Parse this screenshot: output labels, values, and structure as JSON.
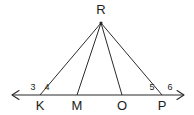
{
  "figure": {
    "type": "geometry-diagram",
    "background_color": "#ffffff",
    "stroke_color": "#2b2b2b",
    "text_color": "#1c1c1c",
    "apex": {
      "name": "apex-point",
      "label": "R",
      "x": 101,
      "y": 23,
      "label_x": 101,
      "label_y": 14
    },
    "baseline": {
      "name": "base-line",
      "y": 95,
      "x_start": 12,
      "x_end": 184,
      "arrow_left": true,
      "arrow_right": true
    },
    "base_points": [
      {
        "label": "K",
        "x": 40,
        "label_x": 40,
        "label_y": 110
      },
      {
        "label": "M",
        "x": 77,
        "label_x": 77,
        "label_y": 110
      },
      {
        "label": "O",
        "x": 122,
        "label_x": 122,
        "label_y": 110
      },
      {
        "label": "P",
        "x": 162,
        "label_x": 162,
        "label_y": 110
      }
    ],
    "segments": [
      {
        "name": "segment-RK",
        "from": "R",
        "to": "K"
      },
      {
        "name": "segment-RM",
        "from": "R",
        "to": "M"
      },
      {
        "name": "segment-RO",
        "from": "R",
        "to": "O"
      },
      {
        "name": "segment-RP",
        "from": "R",
        "to": "P"
      }
    ],
    "angle_labels": [
      {
        "label": "3",
        "x": 33,
        "y": 90,
        "at_vertex": "K",
        "side": "left"
      },
      {
        "label": "4",
        "x": 47,
        "y": 90,
        "at_vertex": "K",
        "side": "right"
      },
      {
        "label": "5",
        "x": 152,
        "y": 90,
        "at_vertex": "P",
        "side": "left"
      },
      {
        "label": "6",
        "x": 170,
        "y": 90,
        "at_vertex": "P",
        "side": "right"
      }
    ]
  }
}
